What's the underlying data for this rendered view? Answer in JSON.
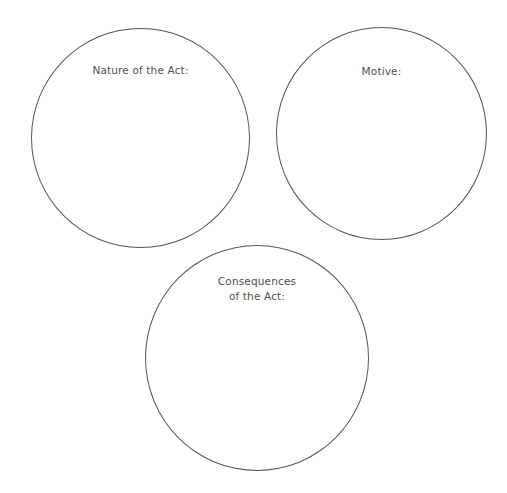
{
  "page": {
    "background_color": "#ffffff",
    "stroke_color": "#55555a",
    "text_color": "#4f4f4f"
  },
  "circles": [
    {
      "id": "nature",
      "label": "Nature of the Act:"
    },
    {
      "id": "motive",
      "label": "Motive:"
    },
    {
      "id": "consequences",
      "label": "Consequences\nof the Act:"
    }
  ]
}
